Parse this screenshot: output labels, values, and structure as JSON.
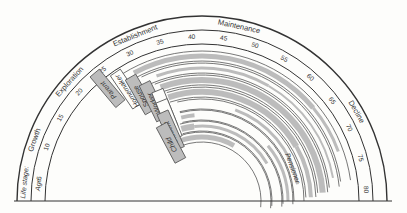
{
  "row_labels": {
    "life_stage": "Life stage:",
    "age": "Age:"
  },
  "life_stages": [
    {
      "label": "Growth",
      "angle_deg": 160
    },
    {
      "label": "Exploration",
      "angle_deg": 138
    },
    {
      "label": "Establishment",
      "angle_deg": 112
    },
    {
      "label": "Maintenance",
      "angle_deg": 78
    },
    {
      "label": "Decline",
      "angle_deg": 30
    }
  ],
  "ages": [
    "5",
    "10",
    "15",
    "20",
    "25",
    "30",
    "35",
    "40",
    "45",
    "50",
    "55",
    "60",
    "65",
    "70",
    "75",
    "80"
  ],
  "roles": [
    {
      "label": "Parent",
      "style": "dark"
    },
    {
      "label": "Homemaker",
      "style": "light"
    },
    {
      "label": "Spouse",
      "style": "dark"
    },
    {
      "label": "Worker",
      "style": "dark"
    },
    {
      "label": "Citizen",
      "style": "light"
    },
    {
      "label": "Leisure",
      "style": "light"
    },
    {
      "label": "Student",
      "style": "dark"
    },
    {
      "label": "Child",
      "style": "dark"
    }
  ],
  "extra_labels": {
    "pensioner": "Pensioner"
  },
  "colors": {
    "line": "#333333",
    "shade": "#bcbcbc",
    "background": "#fdfdfb"
  }
}
